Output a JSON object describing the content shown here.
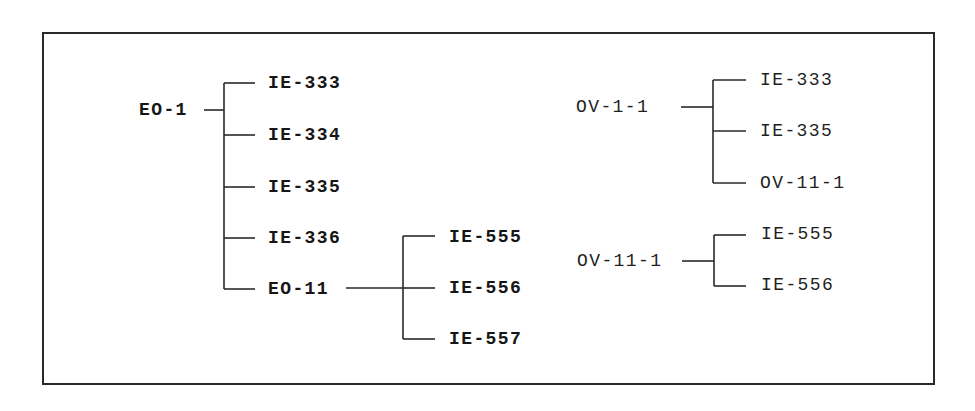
{
  "diagram": {
    "type": "tree-hierarchy",
    "colors": {
      "line": "#2a2a2a",
      "text": "#1a1a1a",
      "background": "#ffffff"
    },
    "trees": [
      {
        "root": "EO-1",
        "children": [
          "IE-333",
          "IE-334",
          "IE-335",
          "IE-336",
          "EO-11"
        ]
      },
      {
        "root": "EO-11",
        "children": [
          "IE-555",
          "IE-556",
          "IE-557"
        ]
      },
      {
        "root": "OV-1-1",
        "children": [
          "IE-333",
          "IE-335",
          "OV-11-1"
        ]
      },
      {
        "root": "OV-11-1",
        "children": [
          "IE-555",
          "IE-556"
        ]
      }
    ]
  },
  "labels": {
    "eo1": "EO-1",
    "eo1_c0": "IE-333",
    "eo1_c1": "IE-334",
    "eo1_c2": "IE-335",
    "eo1_c3": "IE-336",
    "eo11": "EO-11",
    "eo11_c0": "IE-555",
    "eo11_c1": "IE-556",
    "eo11_c2": "IE-557",
    "ov11": "OV-1-1",
    "ov11_c0": "IE-333",
    "ov11_c1": "IE-335",
    "ov11_c2": "OV-11-1",
    "ov111": "OV-11-1",
    "ov111_c0": "IE-555",
    "ov111_c1": "IE-556"
  }
}
